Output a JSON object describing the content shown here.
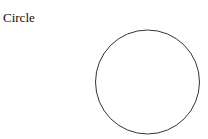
{
  "title": "Circle",
  "shape": {
    "type": "circle",
    "cx": 147.5,
    "cy": 82,
    "r": 52,
    "stroke": "#333333",
    "fill": "none",
    "stroke_width": 1
  }
}
